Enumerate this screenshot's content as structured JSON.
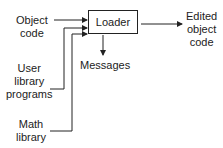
{
  "diagram": {
    "center": "Loader",
    "inputs": [
      {
        "line1": "Object",
        "line2": "code"
      },
      {
        "line1": "User",
        "line2": "library",
        "line3": "programs"
      },
      {
        "line1": "Math",
        "line2": "library"
      }
    ],
    "output": {
      "line1": "Edited",
      "line2": "object",
      "line3": "code"
    },
    "messages": "Messages"
  }
}
